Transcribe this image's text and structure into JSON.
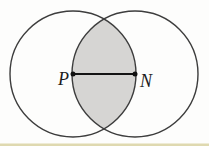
{
  "figure": {
    "colors": {
      "background": "#fdfdfc",
      "circle_stroke": "#3d3d3d",
      "intersection_fill": "#d6d5d3",
      "segment_stroke": "#141414",
      "point_fill": "#111111",
      "label_color": "#1c1c1c",
      "scan_strip": "#d9d2a2"
    },
    "geometry": {
      "left_circle": {
        "cx": 73,
        "cy": 74,
        "r": 63
      },
      "right_circle": {
        "cx": 135,
        "cy": 74,
        "r": 63
      },
      "segment": {
        "x1": 73,
        "y1": 74,
        "x2": 135,
        "y2": 74
      },
      "point_p": {
        "cx": 73,
        "cy": 74,
        "r": 2.5
      },
      "point_n": {
        "cx": 135,
        "cy": 74,
        "r": 2.5
      },
      "scan_strip": {
        "x": 0,
        "y": 143.5,
        "width": 209,
        "height": 2.5
      }
    },
    "labels": {
      "p": {
        "text": "P",
        "x": 58,
        "y": 85
      },
      "n": {
        "text": "N",
        "x": 140,
        "y": 87
      }
    }
  }
}
